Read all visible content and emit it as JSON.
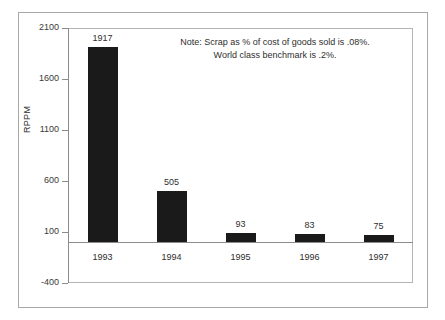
{
  "chart_data": {
    "type": "bar",
    "title": "",
    "subtitle": "",
    "xlabel": "",
    "ylabel": "RPPM",
    "categories": [
      "1993",
      "1994",
      "1995",
      "1996",
      "1997"
    ],
    "values": [
      1917,
      505,
      93,
      83,
      75
    ],
    "value_labels": [
      "1917",
      "505",
      "93",
      "83",
      "75"
    ],
    "series": [
      {
        "name": "RPPM",
        "values": [
          1917,
          505,
          93,
          83,
          75
        ]
      }
    ],
    "ylim": [
      -400,
      2100
    ],
    "ytick_labels": [
      "2100",
      "1600",
      "1100",
      "600",
      "100",
      "-400"
    ],
    "ytick_values": [
      2100,
      1600,
      1100,
      600,
      100,
      -400
    ],
    "grid": false,
    "legend": false,
    "legend_position": "none",
    "bar_color": "#1a1a1a",
    "axis_color": "#8c8c8c",
    "frame_color": "#a8a8a8",
    "annotations": [
      "Note: Scrap as % of cost of goods sold is .08%.",
      "World class benchmark is .2%."
    ]
  },
  "note": {
    "line1": "Note: Scrap as % of cost of goods sold is .08%.",
    "line2": "World class benchmark is .2%."
  },
  "axis": {
    "y_title": "RPPM"
  }
}
